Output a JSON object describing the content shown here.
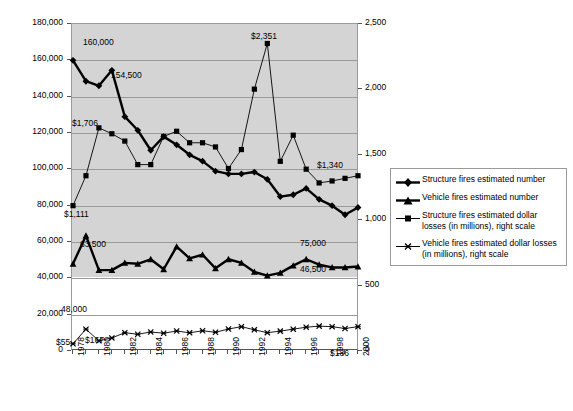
{
  "chart_data": {
    "type": "line",
    "title": "",
    "xlabel": "",
    "ylabel": "",
    "ylabel_right": "",
    "grid": true,
    "legend_position": "right",
    "x": [
      1978,
      1979,
      1980,
      1981,
      1982,
      1983,
      1984,
      1985,
      1986,
      1987,
      1988,
      1989,
      1990,
      1991,
      1992,
      1993,
      1994,
      1995,
      1996,
      1997,
      1998,
      1999,
      2000
    ],
    "xtick_labels": [
      "1978",
      "1980",
      "1982",
      "1984",
      "1986",
      "1988",
      "1990",
      "1992",
      "1994",
      "1996",
      "1998",
      "2000"
    ],
    "ylim": [
      0,
      180000
    ],
    "ytick_labels": [
      "0",
      "20,000",
      "40,000",
      "60,000",
      "80,000",
      "100,000",
      "120,000",
      "140,000",
      "160,000",
      "180,000"
    ],
    "ylim_right": [
      0,
      2500
    ],
    "ytick_labels_right": [
      "0",
      "500",
      "1,000",
      "1,500",
      "2,000",
      "2,500"
    ],
    "series": [
      {
        "name": "Structure fires estimated number",
        "axis": "left",
        "marker": "diamond",
        "weight": "thick",
        "values": [
          160000,
          148500,
          146000,
          154500,
          129000,
          121500,
          110500,
          118000,
          113500,
          108000,
          104500,
          99000,
          97500,
          97500,
          98500,
          94500,
          85000,
          86000,
          89500,
          83500,
          80000,
          75000,
          79000
        ]
      },
      {
        "name": "Vehicle fires estimated number",
        "axis": "left",
        "marker": "triangle",
        "weight": "thick",
        "values": [
          48000,
          63500,
          44500,
          44500,
          48500,
          48000,
          50500,
          45000,
          57500,
          51000,
          53000,
          45500,
          50500,
          48500,
          43500,
          41500,
          43000,
          47000,
          50500,
          47500,
          46000,
          46000,
          46500
        ]
      },
      {
        "name": "Structure fires estimated dollar losses (in millions), right scale",
        "axis": "right",
        "marker": "square",
        "weight": "thin",
        "values": [
          1111,
          1340,
          1706,
          1661,
          1605,
          1425,
          1425,
          1640,
          1680,
          1592,
          1592,
          1560,
          1395,
          1540,
          2002,
          2351,
          1450,
          1650,
          1390,
          1285,
          1300,
          1320,
          1340
        ]
      },
      {
        "name": "Vehicle fires estimated dollar losses (in millions), right scale",
        "axis": "right",
        "marker": "cross",
        "weight": "thin",
        "values": [
          55,
          167,
          78,
          100,
          140,
          128,
          145,
          136,
          153,
          139,
          155,
          143,
          168,
          186,
          162,
          140,
          152,
          167,
          182,
          190,
          186,
          172,
          186
        ]
      }
    ],
    "annotations": [
      {
        "text": "160,000",
        "x": 1978,
        "series": "Structure fires estimated number"
      },
      {
        "text": "154,500",
        "x": 1981,
        "series": "Structure fires estimated number"
      },
      {
        "text": "75,000",
        "x": 1999,
        "series": "Structure fires estimated number"
      },
      {
        "text": "48,000",
        "x": 1978,
        "series": "Vehicle fires estimated number"
      },
      {
        "text": "63,500",
        "x": 1979,
        "series": "Vehicle fires estimated number"
      },
      {
        "text": "46,500",
        "x": 2000,
        "series": "Vehicle fires estimated number"
      },
      {
        "text": "$1,111",
        "x": 1978,
        "series": "Structure fires estimated dollar losses (in millions), right scale"
      },
      {
        "text": "$1,706",
        "x": 1980,
        "series": "Structure fires estimated dollar losses (in millions), right scale"
      },
      {
        "text": "$2,351",
        "x": 1993,
        "series": "Structure fires estimated dollar losses (in millions), right scale"
      },
      {
        "text": "$1,340",
        "x": 2000,
        "series": "Structure fires estimated dollar losses (in millions), right scale"
      },
      {
        "text": "$55",
        "x": 1978,
        "series": "Vehicle fires estimated dollar losses (in millions), right scale"
      },
      {
        "text": "$167",
        "x": 1979,
        "series": "Vehicle fires estimated dollar losses (in millions), right scale"
      },
      {
        "text": "$186",
        "x": 2000,
        "series": "Vehicle fires estimated dollar losses (in millions), right scale"
      }
    ],
    "colors": {
      "series_line": "#000000",
      "plot_shade": "#d4d4d4",
      "grid": "#9a9a9a",
      "axis": "#555555",
      "background": "#ffffff"
    }
  },
  "axes": {
    "left_ticks": [
      "180,000",
      "160,000",
      "140,000",
      "120,000",
      "100,000",
      "80,000",
      "60,000",
      "40,000",
      "20,000",
      "0"
    ],
    "right_ticks": [
      "2,500",
      "2,000",
      "1,500",
      "1,000",
      "500",
      "0"
    ],
    "x_ticks": [
      "1978",
      "1980",
      "1982",
      "1984",
      "1986",
      "1988",
      "1990",
      "1992",
      "1994",
      "1996",
      "1998",
      "2000"
    ]
  },
  "legend": {
    "items": [
      {
        "label": "Structure fires estimated number",
        "marker": "diamond-thick"
      },
      {
        "label": "Vehicle fires estimated number",
        "marker": "triangle-thick"
      },
      {
        "label": "Structure fires estimated dollar losses (in millions), right scale",
        "marker": "square-thin"
      },
      {
        "label": "Vehicle fires estimated dollar losses (in millions), right scale",
        "marker": "cross-thin"
      }
    ]
  },
  "labels": {
    "structure_start": "160,000",
    "structure_1981": "154,500",
    "structure_end": "75,000",
    "vehicle_start": "48,000",
    "vehicle_peak": "63,500",
    "vehicle_end": "46,500",
    "sloss_start": "$1,111",
    "sloss_1980": "$1,706",
    "sloss_peak": "$2,351",
    "sloss_end": "$1,340",
    "vloss_start": "$55",
    "vloss_1979": "$167",
    "vloss_end": "$186"
  },
  "title": ""
}
